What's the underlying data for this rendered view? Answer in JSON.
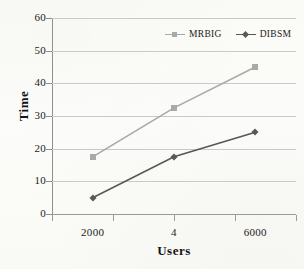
{
  "chart_data": {
    "type": "line",
    "title": "",
    "xlabel": "Users",
    "ylabel": "Time",
    "x": [
      2000,
      4000,
      6000
    ],
    "categories": [
      "2000",
      "4",
      "6000"
    ],
    "xtick_labels": [
      "2000",
      "4",
      "6000"
    ],
    "ytick_labels": [
      "0",
      "10",
      "20",
      "30",
      "40",
      "50",
      "60"
    ],
    "yticks": [
      0,
      10,
      20,
      30,
      40,
      50,
      60
    ],
    "ylim": [
      0,
      60
    ],
    "xlim": [
      1000,
      7000
    ],
    "grid": "horizontal",
    "legend_position": "top-right-inside",
    "series": [
      {
        "name": "MRBIG",
        "values": [
          17.5,
          32.5,
          45
        ],
        "color": "#a9a9a9",
        "marker": "square"
      },
      {
        "name": "DIBSM",
        "values": [
          5,
          17.5,
          25
        ],
        "color": "#585858",
        "marker": "diamond"
      }
    ]
  },
  "axes": {
    "y_title": "Time",
    "x_title": "Users"
  },
  "legend": {
    "entries": [
      {
        "label": "MRBIG"
      },
      {
        "label": "DIBSM"
      }
    ]
  },
  "colors": {
    "series_mrbig": "#a9a9a9",
    "series_dibsm": "#585858",
    "gridline": "#c9c9c9",
    "axis": "#8f8f8f",
    "background": "#fdfdfb"
  }
}
